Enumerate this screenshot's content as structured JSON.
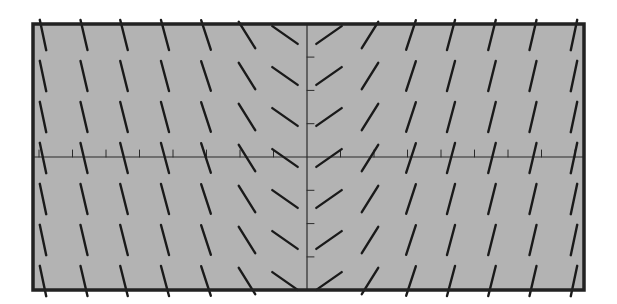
{
  "chart_data": {
    "type": "slope-field",
    "title": "",
    "xlabel": "",
    "ylabel": "",
    "equation_hint": "slope depends only on x; symmetric about y-axis (negative for x<0, positive for x>0)",
    "grid": false,
    "legend": null,
    "x_axis_tick_count_each_side": 8,
    "y_axis_tick_count_each_side": 3,
    "columns_x_offset_px": [
      -264,
      -223,
      -183,
      -142,
      -101,
      -60,
      -22,
      22,
      63,
      104,
      144,
      185,
      226,
      267
    ],
    "column_angles_deg": [
      -78,
      -77,
      -76,
      -75,
      -72,
      -58,
      -35,
      35,
      58,
      72,
      75,
      76,
      77,
      78
    ],
    "rows_y_px": [
      35,
      76,
      117,
      158,
      199,
      240,
      281
    ],
    "segment_length_px": 31
  },
  "colors": {
    "background": "#ffffff",
    "plot_fill": "#b3b3b3",
    "border": "#222222",
    "axis": "#2a2a2a",
    "segment": "#1a1a1a"
  },
  "frame": {
    "left": 33,
    "top": 24,
    "right": 584,
    "bottom": 290
  },
  "axes": {
    "origin_x": 307,
    "origin_y": 157,
    "x_tick_spacing": 33.5,
    "y_tick_spacing": 33.3
  }
}
